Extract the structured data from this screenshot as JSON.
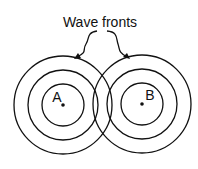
{
  "title": "Wave fronts",
  "sources": [
    {
      "label": "A",
      "cx": 63,
      "cy": 105
    },
    {
      "label": "B",
      "cx": 142,
      "cy": 104
    }
  ],
  "radii": [
    49,
    35,
    21
  ],
  "colors": {
    "stroke": "#111111",
    "background": "#ffffff"
  }
}
